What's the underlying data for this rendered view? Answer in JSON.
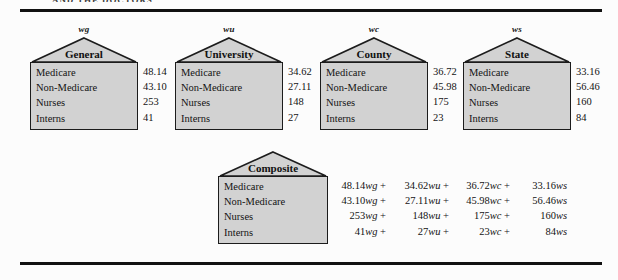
{
  "page": {
    "clipped_header_text": "AND THE DOCTORS",
    "background_color": "#fcfcfc",
    "rule_color": "#111111",
    "house_fill_color": "#d2d2d2",
    "house_border_color": "#1c1c1c"
  },
  "row_labels": [
    "Medicare",
    "Non-Medicare",
    "Nurses",
    "Interns"
  ],
  "houses": [
    {
      "weight_label": "wg",
      "title": "General",
      "values": [
        "48.14",
        "43.10",
        "253",
        "41"
      ]
    },
    {
      "weight_label": "wu",
      "title": "University",
      "values": [
        "34.62",
        "27.11",
        "148",
        "27"
      ]
    },
    {
      "weight_label": "wc",
      "title": "County",
      "values": [
        "36.72",
        "45.98",
        "175",
        "23"
      ]
    },
    {
      "weight_label": "ws",
      "title": "State",
      "values": [
        "33.16",
        "56.46",
        "160",
        "84"
      ]
    }
  ],
  "composite": {
    "title": "Composite",
    "rows": [
      {
        "label": "Medicare",
        "terms": [
          {
            "coef": "48.14",
            "w": "wg",
            "op": " + "
          },
          {
            "coef": "34.62",
            "w": "wu",
            "op": " + "
          },
          {
            "coef": "36.72",
            "w": "wc",
            "op": " + "
          },
          {
            "coef": "33.16",
            "w": "ws",
            "op": ""
          }
        ]
      },
      {
        "label": "Non-Medicare",
        "terms": [
          {
            "coef": "43.10",
            "w": "wg",
            "op": " + "
          },
          {
            "coef": "27.11",
            "w": "wu",
            "op": " + "
          },
          {
            "coef": "45.98",
            "w": "wc",
            "op": " + "
          },
          {
            "coef": "56.46",
            "w": "ws",
            "op": ""
          }
        ]
      },
      {
        "label": "Nurses",
        "terms": [
          {
            "coef": "253",
            "w": "wg",
            "op": " + "
          },
          {
            "coef": "148",
            "w": "wu",
            "op": " + "
          },
          {
            "coef": "175",
            "w": "wc",
            "op": " + "
          },
          {
            "coef": "160",
            "w": "ws",
            "op": ""
          }
        ]
      },
      {
        "label": "Interns",
        "terms": [
          {
            "coef": "41",
            "w": "wg",
            "op": " + "
          },
          {
            "coef": "27",
            "w": "wu",
            "op": " + "
          },
          {
            "coef": "23",
            "w": "wc",
            "op": " + "
          },
          {
            "coef": "84",
            "w": "ws",
            "op": ""
          }
        ]
      }
    ]
  }
}
